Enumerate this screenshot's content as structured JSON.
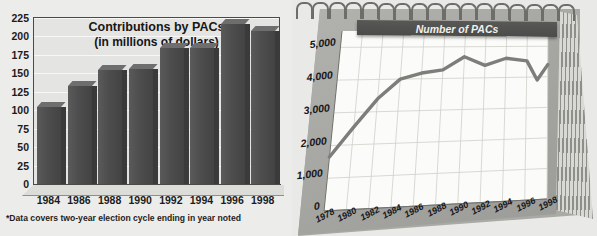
{
  "figure": {
    "background_color": "#e9e9e7"
  },
  "bar_chart": {
    "title_line1": "Contributions by PACs",
    "title_line2": "(in millions of dollars)",
    "footnote": "*Data covers two-year election cycle ending in year noted",
    "bar_color": "#4d4d4d",
    "frame_color": "#4a4a4a"
  },
  "line_chart": {
    "title": "Number of PACs",
    "line_color": "#7d7d7a",
    "paper_color": "#fbfbf9",
    "pad_color": "#a3a3a0",
    "ring_count": 17
  },
  "chart_data": [
    {
      "type": "bar",
      "title": "Contributions by PACs (in millions of dollars)",
      "xlabel": "",
      "ylabel": "",
      "categories": [
        "1984",
        "1986",
        "1988",
        "1990",
        "1992",
        "1994",
        "1996",
        "1998"
      ],
      "values": [
        105,
        133,
        155,
        156,
        185,
        185,
        217,
        208
      ],
      "ylim": [
        0,
        225
      ],
      "yticks": [
        0,
        25,
        50,
        75,
        100,
        125,
        150,
        175,
        200,
        225
      ],
      "ytick_labels": [
        "0",
        "25",
        "50",
        "75",
        "100",
        "125",
        "150",
        "175",
        "200",
        "225"
      ],
      "grid": true,
      "legend": false,
      "annotation": "*Data covers two-year election cycle ending in year noted"
    },
    {
      "type": "line",
      "title": "Number of PACs",
      "xlabel": "",
      "ylabel": "",
      "x": [
        "1978",
        "1980",
        "1982",
        "1984",
        "1986",
        "1988",
        "1990",
        "1992",
        "1994",
        "1996",
        "1997",
        "1998"
      ],
      "values": [
        1650,
        2550,
        3400,
        4000,
        4180,
        4270,
        4680,
        4400,
        4620,
        4530,
        3900,
        4400
      ],
      "xtick_labels": [
        "1978",
        "1980",
        "1982",
        "1984",
        "1986",
        "1988",
        "1990",
        "1992",
        "1994",
        "1996",
        "1998"
      ],
      "ylim": [
        0,
        5500
      ],
      "yticks": [
        0,
        1000,
        2000,
        3000,
        4000,
        5000
      ],
      "ytick_labels": [
        "0",
        "1,000",
        "2,000",
        "3,000",
        "4,000",
        "5,000"
      ],
      "grid": true,
      "legend": false
    }
  ]
}
